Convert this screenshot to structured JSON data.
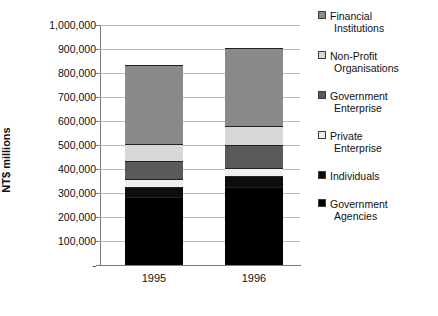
{
  "chart_data": {
    "type": "bar",
    "subtype": "stacked-column",
    "title": "",
    "xlabel": "",
    "ylabel": "NT$ millions",
    "categories": [
      "1995",
      "1996"
    ],
    "ylim": [
      0,
      1000000
    ],
    "ytick_labels": [
      "1,000,000",
      "900,000",
      "800,000",
      "700,000",
      "600,000",
      "500,000",
      "400,000",
      "300,000",
      "200,000",
      "100,000",
      "-"
    ],
    "ytick_values": [
      1000000,
      900000,
      800000,
      700000,
      600000,
      500000,
      400000,
      300000,
      200000,
      100000,
      0
    ],
    "grid": true,
    "legend_position": "right",
    "series": [
      {
        "name": "Government Agencies",
        "color": "#000000",
        "values": [
          283000,
          325000
        ]
      },
      {
        "name": "Individuals",
        "color": "#0d0d0d",
        "values": [
          42000,
          46000
        ]
      },
      {
        "name": "Private Enterprise",
        "color": "#eeeeee",
        "values": [
          33000,
          33000
        ]
      },
      {
        "name": "Government Enterprise",
        "color": "#5a5a5a",
        "values": [
          75000,
          96000
        ]
      },
      {
        "name": "Non-Profit Organisations",
        "color": "#d8d8d8",
        "values": [
          71000,
          79000
        ]
      },
      {
        "name": "Financial Institutions",
        "color": "#8a8a8a",
        "values": [
          329000,
          325000
        ]
      }
    ],
    "totals": [
      833000,
      904000
    ]
  },
  "legend": {
    "items": [
      {
        "label_line1": "Financial",
        "label_line2": "Institutions",
        "swatch": "sw-fin"
      },
      {
        "label_line1": "Non-Profit",
        "label_line2": "Organisations",
        "swatch": "sw-np"
      },
      {
        "label_line1": "Government",
        "label_line2": "Enterprise",
        "swatch": "sw-ge"
      },
      {
        "label_line1": "Private",
        "label_line2": "Enterprise",
        "swatch": "sw-pe"
      },
      {
        "label_line1": "Individuals",
        "label_line2": "",
        "swatch": "sw-ind"
      },
      {
        "label_line1": "Government",
        "label_line2": "Agencies",
        "swatch": "sw-ga"
      }
    ]
  }
}
